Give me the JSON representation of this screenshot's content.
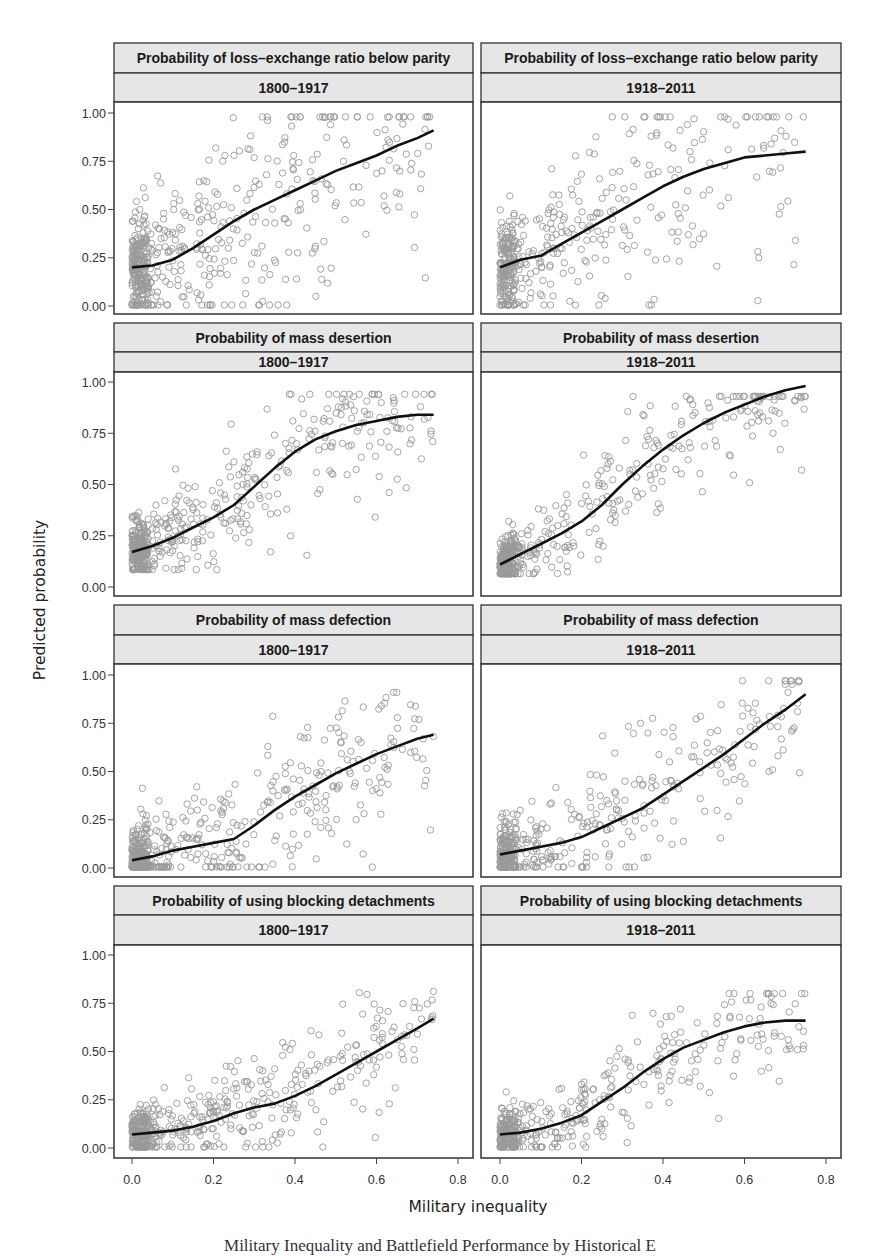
{
  "figure": {
    "ylabel": "Predicted probability",
    "xlabel": "Military inequality",
    "caption": "Military Inequality and Battlefield Performance by Historical E",
    "y_ticks": [
      "0.00",
      "0.25",
      "0.50",
      "0.75",
      "1.00"
    ],
    "x_ticks": [
      "0.0",
      "0.2",
      "0.4",
      "0.6",
      "0.8"
    ],
    "colors": {
      "strip_bg": "#e6e6e6",
      "border": "#333333",
      "points": "#9a9a9a",
      "curve": "#111111"
    }
  },
  "panels": [
    {
      "title": "Probability of loss–exchange ratio below parity",
      "period": "1800–1917"
    },
    {
      "title": "Probability of loss–exchange ratio below parity",
      "period": "1918–2011"
    },
    {
      "title": "Probability of mass desertion",
      "period": "1800–1917"
    },
    {
      "title": "Probability of mass desertion",
      "period": "1918–2011"
    },
    {
      "title": "Probability of mass defection",
      "period": "1800–1917"
    },
    {
      "title": "Probability of mass defection",
      "period": "1918–2011"
    },
    {
      "title": "Probability of using blocking detachments",
      "period": "1800–1917"
    },
    {
      "title": "Probability of using blocking detachments",
      "period": "1918–2011"
    }
  ],
  "chart_data": [
    {
      "type": "scatter",
      "title": "Probability of loss–exchange ratio below parity, 1800–1917",
      "xlabel": "Military inequality",
      "ylabel": "Predicted probability",
      "xlim": [
        -0.03,
        0.85
      ],
      "ylim": [
        -0.05,
        1.05
      ],
      "fit_line": {
        "x": [
          0.0,
          0.05,
          0.1,
          0.15,
          0.2,
          0.25,
          0.3,
          0.35,
          0.4,
          0.45,
          0.5,
          0.55,
          0.6,
          0.65,
          0.7,
          0.74
        ],
        "y": [
          0.2,
          0.21,
          0.24,
          0.3,
          0.37,
          0.44,
          0.5,
          0.55,
          0.6,
          0.65,
          0.7,
          0.74,
          0.78,
          0.83,
          0.87,
          0.91
        ]
      },
      "scatter_summary": {
        "n_approx": 520,
        "x_range": [
          0.0,
          0.74
        ],
        "y_range": [
          0.0,
          0.98
        ],
        "spread": 0.22
      }
    },
    {
      "type": "scatter",
      "title": "Probability of loss–exchange ratio below parity, 1918–2011",
      "xlabel": "Military inequality",
      "ylabel": "Predicted probability",
      "xlim": [
        -0.03,
        0.85
      ],
      "ylim": [
        -0.05,
        1.05
      ],
      "fit_line": {
        "x": [
          0.0,
          0.05,
          0.1,
          0.15,
          0.2,
          0.25,
          0.3,
          0.35,
          0.4,
          0.45,
          0.5,
          0.55,
          0.6,
          0.65,
          0.7,
          0.75
        ],
        "y": [
          0.2,
          0.24,
          0.26,
          0.32,
          0.38,
          0.44,
          0.5,
          0.56,
          0.62,
          0.67,
          0.71,
          0.74,
          0.77,
          0.78,
          0.79,
          0.8
        ]
      },
      "scatter_summary": {
        "n_approx": 420,
        "x_range": [
          0.0,
          0.75
        ],
        "y_range": [
          0.0,
          0.98
        ],
        "spread": 0.2
      }
    },
    {
      "type": "scatter",
      "title": "Probability of mass desertion, 1800–1917",
      "xlabel": "Military inequality",
      "ylabel": "Predicted probability",
      "xlim": [
        -0.03,
        0.85
      ],
      "ylim": [
        -0.05,
        1.05
      ],
      "fit_line": {
        "x": [
          0.0,
          0.05,
          0.1,
          0.15,
          0.2,
          0.25,
          0.3,
          0.35,
          0.4,
          0.45,
          0.5,
          0.55,
          0.6,
          0.65,
          0.7,
          0.74
        ],
        "y": [
          0.17,
          0.2,
          0.24,
          0.29,
          0.34,
          0.4,
          0.49,
          0.58,
          0.66,
          0.72,
          0.76,
          0.79,
          0.81,
          0.83,
          0.84,
          0.84
        ]
      },
      "scatter_summary": {
        "n_approx": 500,
        "x_range": [
          0.0,
          0.74
        ],
        "y_range": [
          0.08,
          0.94
        ],
        "spread": 0.12
      }
    },
    {
      "type": "scatter",
      "title": "Probability of mass desertion, 1918–2011",
      "xlabel": "Military inequality",
      "ylabel": "Predicted probability",
      "xlim": [
        -0.03,
        0.85
      ],
      "ylim": [
        -0.05,
        1.05
      ],
      "fit_line": {
        "x": [
          0.0,
          0.05,
          0.1,
          0.15,
          0.2,
          0.25,
          0.3,
          0.35,
          0.4,
          0.45,
          0.5,
          0.55,
          0.6,
          0.65,
          0.7,
          0.75
        ],
        "y": [
          0.11,
          0.16,
          0.21,
          0.26,
          0.32,
          0.4,
          0.5,
          0.59,
          0.67,
          0.74,
          0.8,
          0.85,
          0.89,
          0.93,
          0.96,
          0.98
        ]
      },
      "scatter_summary": {
        "n_approx": 420,
        "x_range": [
          0.0,
          0.75
        ],
        "y_range": [
          0.06,
          0.93
        ],
        "spread": 0.1
      }
    },
    {
      "type": "scatter",
      "title": "Probability of mass defection, 1800–1917",
      "xlabel": "Military inequality",
      "ylabel": "Predicted probability",
      "xlim": [
        -0.03,
        0.85
      ],
      "ylim": [
        -0.05,
        1.05
      ],
      "fit_line": {
        "x": [
          0.0,
          0.05,
          0.1,
          0.15,
          0.2,
          0.25,
          0.3,
          0.35,
          0.4,
          0.45,
          0.5,
          0.55,
          0.6,
          0.65,
          0.7,
          0.74
        ],
        "y": [
          0.04,
          0.06,
          0.09,
          0.11,
          0.13,
          0.15,
          0.22,
          0.3,
          0.37,
          0.43,
          0.49,
          0.54,
          0.59,
          0.63,
          0.67,
          0.69
        ]
      },
      "scatter_summary": {
        "n_approx": 480,
        "x_range": [
          0.0,
          0.74
        ],
        "y_range": [
          0.0,
          0.91
        ],
        "spread": 0.15
      }
    },
    {
      "type": "scatter",
      "title": "Probability of mass defection, 1918–2011",
      "xlabel": "Military inequality",
      "ylabel": "Predicted probability",
      "xlim": [
        -0.03,
        0.85
      ],
      "ylim": [
        -0.05,
        1.05
      ],
      "fit_line": {
        "x": [
          0.0,
          0.05,
          0.1,
          0.15,
          0.2,
          0.25,
          0.3,
          0.35,
          0.4,
          0.45,
          0.5,
          0.55,
          0.6,
          0.65,
          0.7,
          0.75
        ],
        "y": [
          0.07,
          0.09,
          0.11,
          0.13,
          0.16,
          0.21,
          0.26,
          0.31,
          0.38,
          0.45,
          0.52,
          0.59,
          0.67,
          0.75,
          0.82,
          0.9
        ]
      },
      "scatter_summary": {
        "n_approx": 420,
        "x_range": [
          0.0,
          0.75
        ],
        "y_range": [
          0.0,
          0.97
        ],
        "spread": 0.14
      }
    },
    {
      "type": "scatter",
      "title": "Probability of using blocking detachments, 1800–1917",
      "xlabel": "Military inequality",
      "ylabel": "Predicted probability",
      "xlim": [
        -0.03,
        0.85
      ],
      "ylim": [
        -0.05,
        1.05
      ],
      "fit_line": {
        "x": [
          0.0,
          0.05,
          0.1,
          0.15,
          0.2,
          0.25,
          0.3,
          0.35,
          0.4,
          0.45,
          0.5,
          0.55,
          0.6,
          0.65,
          0.7,
          0.74
        ],
        "y": [
          0.07,
          0.08,
          0.09,
          0.11,
          0.14,
          0.18,
          0.21,
          0.23,
          0.27,
          0.32,
          0.38,
          0.44,
          0.5,
          0.56,
          0.62,
          0.67
        ]
      },
      "scatter_summary": {
        "n_approx": 480,
        "x_range": [
          0.0,
          0.74
        ],
        "y_range": [
          0.0,
          0.82
        ],
        "spread": 0.1
      }
    },
    {
      "type": "scatter",
      "title": "Probability of using blocking detachments, 1918–2011",
      "xlabel": "Military inequality",
      "ylabel": "Predicted probability",
      "xlim": [
        -0.03,
        0.85
      ],
      "ylim": [
        -0.05,
        1.05
      ],
      "fit_line": {
        "x": [
          0.0,
          0.05,
          0.1,
          0.15,
          0.2,
          0.25,
          0.3,
          0.35,
          0.4,
          0.45,
          0.5,
          0.55,
          0.6,
          0.65,
          0.7,
          0.75
        ],
        "y": [
          0.07,
          0.08,
          0.1,
          0.13,
          0.17,
          0.24,
          0.31,
          0.39,
          0.46,
          0.52,
          0.56,
          0.6,
          0.63,
          0.65,
          0.66,
          0.66
        ]
      },
      "scatter_summary": {
        "n_approx": 400,
        "x_range": [
          0.0,
          0.75
        ],
        "y_range": [
          0.0,
          0.8
        ],
        "spread": 0.1
      }
    }
  ]
}
